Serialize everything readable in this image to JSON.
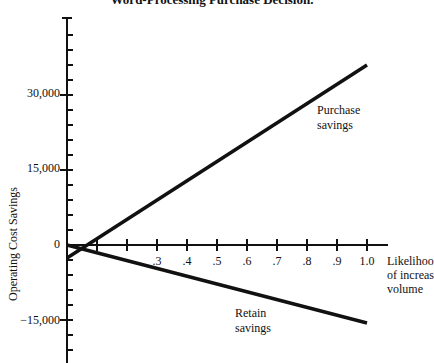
{
  "chart_data": {
    "type": "line",
    "title": "Word-Processing Purchase Decision.",
    "xlabel": "Likelihood of increased volume",
    "ylabel": "Operating Cost Savings",
    "x_ticks": [
      ".3",
      ".4",
      ".5",
      ".6",
      ".7",
      ".8",
      ".9",
      "1.0"
    ],
    "y_ticks": [
      "30,000",
      "15,000",
      "0",
      "−15,000"
    ],
    "xlim": [
      0,
      1.0
    ],
    "ylim": [
      -21000,
      45000
    ],
    "grid": false,
    "legend": "none (inline annotations)",
    "series": [
      {
        "name": "Purchase savings",
        "x": [
          0,
          1.0
        ],
        "y": [
          -2600,
          36000
        ]
      },
      {
        "name": "Retain savings",
        "x": [
          0,
          1.0
        ],
        "y": [
          0,
          -15600
        ]
      }
    ],
    "annotations": [
      "Purchase savings",
      "Retain savings"
    ]
  },
  "labels": {
    "title": "Word-Processing Purchase Decision.",
    "ylabel": "Operating Cost Savings",
    "xlabel_lines": [
      "Likelihoo",
      "of increas",
      "volume"
    ],
    "y_tick_30000": "30,000",
    "y_tick_15000": "15,000",
    "y_tick_0": "0",
    "y_tick_neg15000": "−15,000",
    "x_ticks": [
      ".3",
      ".4",
      ".5",
      ".6",
      ".7",
      ".8",
      ".9",
      "1.0"
    ],
    "purchase_line1": "Purchase",
    "purchase_line2": "savings",
    "retain_line1": "Retain",
    "retain_line2": "savings"
  }
}
